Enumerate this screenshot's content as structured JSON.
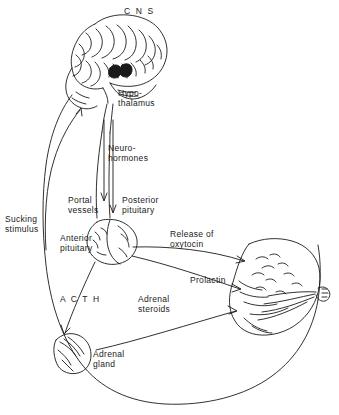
{
  "figure": {
    "title": "C N S",
    "line_color": "#1a1a1a",
    "background": "#ffffff"
  },
  "labels": [
    {
      "id": "cns",
      "text": "C N S",
      "x": 124,
      "y": 8,
      "spaced": true
    },
    {
      "id": "hypothalamus",
      "text": "Hypo-\nthalamus",
      "x": 118,
      "y": 89,
      "spaced": false
    },
    {
      "id": "neurohormones",
      "text": "Neuro-\nhormones",
      "x": 108,
      "y": 144,
      "spaced": false
    },
    {
      "id": "portal-vessels",
      "text": "Portal\nvessels",
      "x": 70,
      "y": 196,
      "spaced": false
    },
    {
      "id": "posterior-pituitary",
      "text": "Posterior\npituitary",
      "x": 122,
      "y": 196,
      "spaced": false
    },
    {
      "id": "sucking-stimulus",
      "text": "Sucking\nstimulus",
      "x": 6,
      "y": 215,
      "spaced": false
    },
    {
      "id": "anterior-pituitary",
      "text": "Anterior\npituitary",
      "x": 62,
      "y": 234,
      "spaced": false
    },
    {
      "id": "release-of-oxytocin",
      "text": "Release of\noxytocin",
      "x": 170,
      "y": 230,
      "spaced": false
    },
    {
      "id": "prolactin",
      "text": "Prolactin",
      "x": 190,
      "y": 276,
      "spaced": false
    },
    {
      "id": "acth",
      "text": "A C T H",
      "x": 60,
      "y": 295,
      "spaced": true
    },
    {
      "id": "adrenal-steroids",
      "text": "Adrenal\nsteroids",
      "x": 138,
      "y": 295,
      "spaced": false
    },
    {
      "id": "adrenal-gland",
      "text": "Adrenal\ngland",
      "x": 93,
      "y": 350,
      "spaced": false
    }
  ]
}
